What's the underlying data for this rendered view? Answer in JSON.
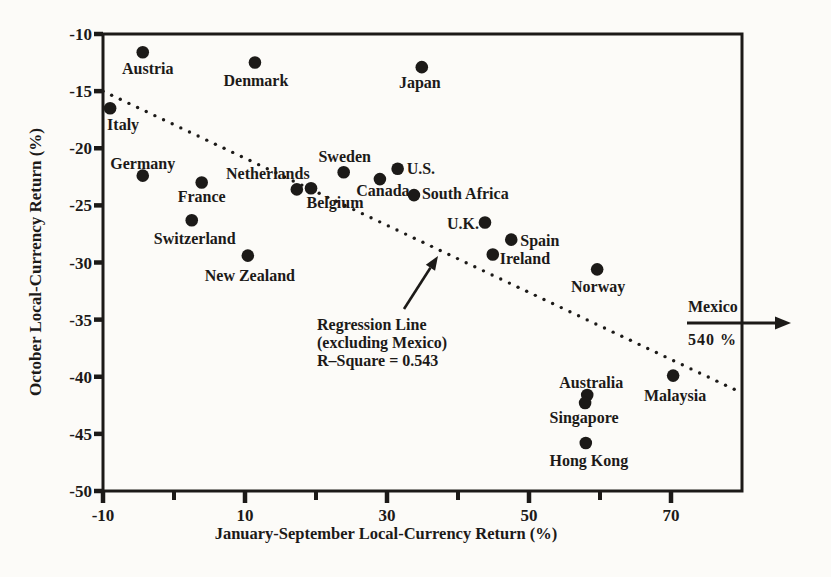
{
  "chart_data": {
    "type": "scatter",
    "title": "",
    "xlabel": "January-September Local-Currency Return (%)",
    "ylabel": "October Local-Currency Return (%)",
    "xlim": [
      -10,
      80
    ],
    "ylim": [
      -50,
      -10
    ],
    "x_major_ticks": [
      -10,
      10,
      30,
      50,
      70
    ],
    "x_minor_ticks": [
      0,
      20,
      40,
      60
    ],
    "y_ticks": [
      -10,
      -15,
      -20,
      -25,
      -30,
      -35,
      -40,
      -45,
      -50
    ],
    "grid": false,
    "points": [
      {
        "name": "Austria",
        "x": -4.4,
        "y": -11.6,
        "anchor": "middle",
        "dx": 5,
        "dy": 22
      },
      {
        "name": "Denmark",
        "x": 11.4,
        "y": -12.5,
        "anchor": "middle",
        "dx": 1,
        "dy": 23
      },
      {
        "name": "Japan",
        "x": 34.9,
        "y": -12.9,
        "anchor": "middle",
        "dx": -2,
        "dy": 21
      },
      {
        "name": "Italy",
        "x": -9.0,
        "y": -16.5,
        "anchor": "start",
        "dx": -3,
        "dy": 22
      },
      {
        "name": "Germany",
        "x": -4.4,
        "y": -22.4,
        "anchor": "middle",
        "dx": 0,
        "dy": -7
      },
      {
        "name": "France",
        "x": 3.9,
        "y": -23.0,
        "anchor": "middle",
        "dx": 0,
        "dy": 19
      },
      {
        "name": "Switzerland",
        "x": 2.5,
        "y": -26.3,
        "anchor": "middle",
        "dx": 3,
        "dy": 24
      },
      {
        "name": "New Zealand",
        "x": 10.4,
        "y": -29.4,
        "anchor": "middle",
        "dx": 2,
        "dy": 25
      },
      {
        "name": "Netherlands",
        "x": 17.3,
        "y": -23.6,
        "anchor": "middle",
        "dx": -29,
        "dy": -10
      },
      {
        "name": "Belgium",
        "x": 19.3,
        "y": -23.5,
        "anchor": "middle",
        "dx": 24,
        "dy": 20
      },
      {
        "name": "Sweden",
        "x": 23.9,
        "y": -22.1,
        "anchor": "middle",
        "dx": 1,
        "dy": -10
      },
      {
        "name": "U.S.",
        "x": 31.5,
        "y": -21.8,
        "anchor": "start",
        "dx": 9,
        "dy": 5
      },
      {
        "name": "Canada",
        "x": 29.0,
        "y": -22.7,
        "anchor": "middle",
        "dx": 3,
        "dy": 17
      },
      {
        "name": "South Africa",
        "x": 33.8,
        "y": -24.1,
        "anchor": "start",
        "dx": 8,
        "dy": 4
      },
      {
        "name": "U.K.",
        "x": 43.8,
        "y": -26.5,
        "anchor": "end",
        "dx": -6,
        "dy": 6
      },
      {
        "name": "Spain",
        "x": 47.5,
        "y": -28.0,
        "anchor": "start",
        "dx": 9,
        "dy": 6
      },
      {
        "name": "Ireland",
        "x": 44.9,
        "y": -29.3,
        "anchor": "start",
        "dx": 7,
        "dy": 9
      },
      {
        "name": "Norway",
        "x": 59.6,
        "y": -30.6,
        "anchor": "middle",
        "dx": 1,
        "dy": 23
      },
      {
        "name": "Australia",
        "x": 58.2,
        "y": -41.6,
        "anchor": "middle",
        "dx": 4,
        "dy": -7
      },
      {
        "name": "Singapore",
        "x": 57.9,
        "y": -42.3,
        "anchor": "middle",
        "dx": -1,
        "dy": 20
      },
      {
        "name": "Hong Kong",
        "x": 58.0,
        "y": -45.8,
        "anchor": "middle",
        "dx": 3,
        "dy": 23
      },
      {
        "name": "Malaysia",
        "x": 70.3,
        "y": -39.9,
        "anchor": "middle",
        "dx": 2,
        "dy": 25
      }
    ],
    "regression_line": {
      "x1": -10,
      "y1": -15.0,
      "x2": 78.9,
      "y2": -41.1,
      "style": "dotted",
      "r_square": 0.543
    },
    "annotations": {
      "regression_note": {
        "lines": [
          "Regression Line",
          "(excluding Mexico)",
          "R–Square = 0.543"
        ],
        "arrow": {
          "x1": 404,
          "y1": 309,
          "x2": 438,
          "y2": 256
        }
      },
      "mexico": {
        "label": "Mexico",
        "value": "540 %",
        "arrow": {
          "x1": 687,
          "y1": 323,
          "x2": 791,
          "y2": 323
        }
      }
    },
    "legend": null,
    "colors": {
      "ink": "#1c1a18",
      "paper": "#fcfbf8"
    },
    "plot_box_px": {
      "left": 103,
      "top": 34,
      "right": 742,
      "bottom": 491
    }
  }
}
